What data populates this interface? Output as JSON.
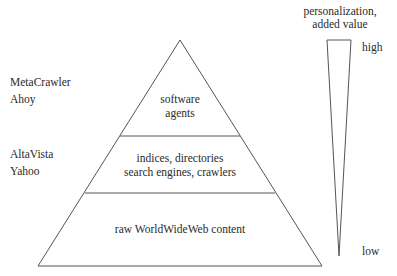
{
  "diagram": {
    "pyramid_layers": [
      {
        "id": "top",
        "lines": [
          "software",
          "agents"
        ]
      },
      {
        "id": "middle",
        "lines": [
          "indices, directories",
          "search engines, crawlers"
        ]
      },
      {
        "id": "bottom",
        "lines": [
          "raw WorldWideWeb content"
        ]
      }
    ],
    "side_examples": [
      {
        "layer": "top",
        "items": [
          "MetaCrawler",
          "Ahoy"
        ]
      },
      {
        "layer": "middle",
        "items": [
          "AltaVista",
          "Yahoo"
        ]
      }
    ],
    "scale": {
      "title_lines": [
        "personalization,",
        "added value"
      ],
      "high_label": "high",
      "low_label": "low"
    }
  }
}
